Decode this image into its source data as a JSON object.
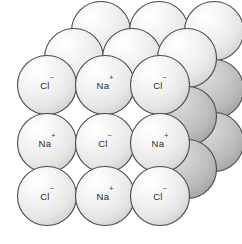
{
  "figure": {
    "name": "sodium-chloride-crystal-lattice",
    "background_color": "#ffffff",
    "width": 242,
    "height": 244
  },
  "style": {
    "sphere_outline_color": "#4a4a4a",
    "sphere_outline_width": 1.1,
    "sphere_light_center": "#ffffff",
    "sphere_light_mid": "#f0f0f0",
    "sphere_light_edge": "#d6d6d6",
    "sphere_shaded_center": "#d2d2d2",
    "sphere_shaded_mid": "#c0c0c0",
    "sphere_shaded_edge": "#a9a9a9",
    "label_color": "#2b2b2b",
    "radius": 29.5
  },
  "labels": {
    "chloride": "Cl",
    "chloride_charge": "−",
    "sodium": "Na",
    "sodium_charge": "+"
  },
  "chart_data": {
    "type": "diagram",
    "ion_types": [
      {
        "id": "cl",
        "label": "Cl",
        "charge": "−",
        "display": "Cl⁻"
      },
      {
        "id": "na",
        "label": "Na",
        "charge": "+",
        "display": "Na⁺"
      }
    ],
    "layers": [
      {
        "name": "back-layer",
        "depth": 2,
        "offset_x": 54,
        "offset_y": -54,
        "spheres": [
          {
            "cx": 101,
            "cy": 31,
            "ion": "cl",
            "shaded": false,
            "labeled": false
          },
          {
            "cx": 159,
            "cy": 31,
            "ion": "na",
            "shaded": false,
            "labeled": false
          },
          {
            "cx": 214,
            "cy": 31,
            "ion": "cl",
            "shaded": false,
            "labeled": false
          },
          {
            "cx": 214,
            "cy": 89,
            "ion": "na",
            "shaded": true,
            "labeled": false
          },
          {
            "cx": 214,
            "cy": 142,
            "ion": "cl",
            "shaded": true,
            "labeled": false
          }
        ]
      },
      {
        "name": "middle-layer",
        "depth": 1,
        "offset_x": 27,
        "offset_y": -27,
        "spheres": [
          {
            "cx": 74,
            "cy": 58,
            "ion": "na",
            "shaded": false,
            "labeled": false
          },
          {
            "cx": 132,
            "cy": 58,
            "ion": "cl",
            "shaded": false,
            "labeled": false
          },
          {
            "cx": 187,
            "cy": 58,
            "ion": "na",
            "shaded": false,
            "labeled": false
          },
          {
            "cx": 187,
            "cy": 116,
            "ion": "cl",
            "shaded": true,
            "labeled": false
          },
          {
            "cx": 187,
            "cy": 169,
            "ion": "na",
            "shaded": true,
            "labeled": false
          }
        ]
      },
      {
        "name": "front-layer",
        "depth": 0,
        "offset_x": 0,
        "offset_y": 0,
        "spheres": [
          {
            "cx": 47,
            "cy": 85,
            "ion": "cl",
            "shaded": false,
            "labeled": true
          },
          {
            "cx": 105,
            "cy": 85,
            "ion": "na",
            "shaded": false,
            "labeled": true
          },
          {
            "cx": 160,
            "cy": 85,
            "ion": "cl",
            "shaded": false,
            "labeled": true
          },
          {
            "cx": 47,
            "cy": 143,
            "ion": "na",
            "shaded": false,
            "labeled": true
          },
          {
            "cx": 105,
            "cy": 143,
            "ion": "cl",
            "shaded": false,
            "labeled": true
          },
          {
            "cx": 160,
            "cy": 143,
            "ion": "na",
            "shaded": false,
            "labeled": true
          },
          {
            "cx": 47,
            "cy": 196,
            "ion": "cl",
            "shaded": false,
            "labeled": true
          },
          {
            "cx": 105,
            "cy": 196,
            "ion": "na",
            "shaded": false,
            "labeled": true
          },
          {
            "cx": 160,
            "cy": 196,
            "ion": "cl",
            "shaded": false,
            "labeled": true
          }
        ]
      }
    ]
  }
}
